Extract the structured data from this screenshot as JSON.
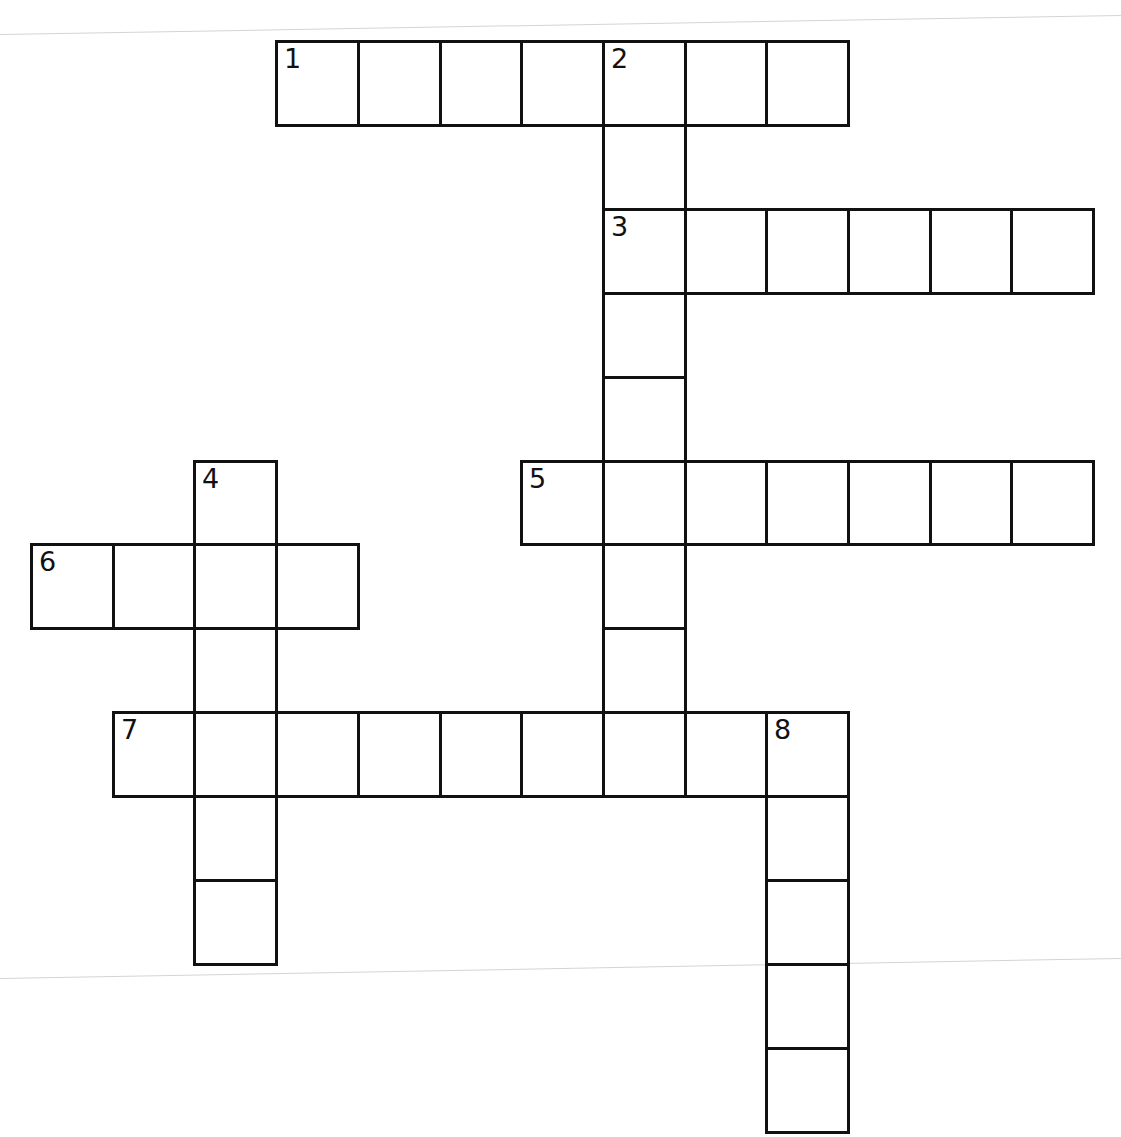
{
  "puzzle": {
    "type": "crossword",
    "grid": {
      "origin_x": 30,
      "origin_y": 40,
      "cell_w": 81.7,
      "cell_h": 83.9,
      "line_color": "#111111",
      "background": "#ffffff"
    },
    "cells": [
      {
        "row": 0,
        "col": 3,
        "num": "1"
      },
      {
        "row": 0,
        "col": 4
      },
      {
        "row": 0,
        "col": 5
      },
      {
        "row": 0,
        "col": 6
      },
      {
        "row": 0,
        "col": 7,
        "num": "2"
      },
      {
        "row": 0,
        "col": 8
      },
      {
        "row": 0,
        "col": 9
      },
      {
        "row": 1,
        "col": 7
      },
      {
        "row": 2,
        "col": 7,
        "num": "3"
      },
      {
        "row": 2,
        "col": 8
      },
      {
        "row": 2,
        "col": 9
      },
      {
        "row": 2,
        "col": 10
      },
      {
        "row": 2,
        "col": 11
      },
      {
        "row": 2,
        "col": 12
      },
      {
        "row": 3,
        "col": 7
      },
      {
        "row": 4,
        "col": 7
      },
      {
        "row": 5,
        "col": 2,
        "num": "4"
      },
      {
        "row": 5,
        "col": 6,
        "num": "5"
      },
      {
        "row": 5,
        "col": 7
      },
      {
        "row": 5,
        "col": 8
      },
      {
        "row": 5,
        "col": 9
      },
      {
        "row": 5,
        "col": 10
      },
      {
        "row": 5,
        "col": 11
      },
      {
        "row": 5,
        "col": 12
      },
      {
        "row": 6,
        "col": 0,
        "num": "6"
      },
      {
        "row": 6,
        "col": 1
      },
      {
        "row": 6,
        "col": 2
      },
      {
        "row": 6,
        "col": 3
      },
      {
        "row": 6,
        "col": 7
      },
      {
        "row": 7,
        "col": 2
      },
      {
        "row": 7,
        "col": 7
      },
      {
        "row": 8,
        "col": 1,
        "num": "7"
      },
      {
        "row": 8,
        "col": 2
      },
      {
        "row": 8,
        "col": 3
      },
      {
        "row": 8,
        "col": 4
      },
      {
        "row": 8,
        "col": 5
      },
      {
        "row": 8,
        "col": 6
      },
      {
        "row": 8,
        "col": 7
      },
      {
        "row": 8,
        "col": 8
      },
      {
        "row": 8,
        "col": 9,
        "num": "8"
      },
      {
        "row": 9,
        "col": 2
      },
      {
        "row": 9,
        "col": 9
      },
      {
        "row": 10,
        "col": 2
      },
      {
        "row": 10,
        "col": 9
      },
      {
        "row": 11,
        "col": 9
      },
      {
        "row": 12,
        "col": 9
      }
    ],
    "entries": {
      "across": [
        {
          "number": "1",
          "row": 0,
          "col": 3,
          "length": 7
        },
        {
          "number": "3",
          "row": 2,
          "col": 7,
          "length": 6
        },
        {
          "number": "5",
          "row": 5,
          "col": 6,
          "length": 7
        },
        {
          "number": "6",
          "row": 6,
          "col": 0,
          "length": 4
        },
        {
          "number": "7",
          "row": 8,
          "col": 1,
          "length": 9
        }
      ],
      "down": [
        {
          "number": "2",
          "row": 0,
          "col": 7,
          "length": 9
        },
        {
          "number": "4",
          "row": 5,
          "col": 2,
          "length": 6
        },
        {
          "number": "8",
          "row": 8,
          "col": 9,
          "length": 5
        }
      ]
    }
  },
  "page": {
    "fold_lines": [
      {
        "y_left": 34,
        "y_right": 15
      },
      {
        "y_left": 978,
        "y_right": 958
      }
    ]
  }
}
